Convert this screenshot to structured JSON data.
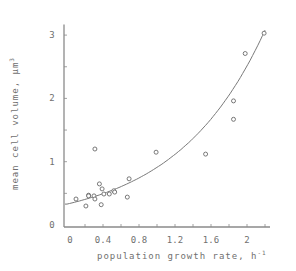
{
  "chart_data": {
    "type": "scatter",
    "title": "",
    "xlabel": "population growth rate, h",
    "xlabel_superscript": "-1",
    "ylabel": "mean cell volume, µm",
    "ylabel_superscript": "3",
    "xlim": [
      0,
      2.2
    ],
    "ylim": [
      0,
      3.2
    ],
    "x_ticks": [
      0,
      0.4,
      0.8,
      1.2,
      1.6,
      2
    ],
    "x_tick_labels": [
      "0",
      "0.4",
      "0.8",
      "1.2",
      "1.6",
      "2"
    ],
    "x_minor_tick_step": 0.2,
    "y_ticks": [
      0,
      1,
      2,
      3
    ],
    "y_tick_labels": [
      "0",
      "1",
      "2",
      "3"
    ],
    "y_minor_tick_step": 0.5,
    "grid": false,
    "legend": null,
    "series": [
      {
        "name": "observations",
        "kind": "scatter",
        "marker": "open-circle",
        "x": [
          0.1,
          0.21,
          0.24,
          0.24,
          0.3,
          0.31,
          0.36,
          0.39,
          0.38,
          0.41,
          0.47,
          0.52,
          0.53,
          0.69,
          0.67,
          0.31,
          0.99,
          1.54,
          1.85,
          1.85,
          1.98,
          2.19
        ],
        "y": [
          0.41,
          0.3,
          0.47,
          0.46,
          0.46,
          0.41,
          0.65,
          0.57,
          0.32,
          0.49,
          0.49,
          0.54,
          0.52,
          0.73,
          0.44,
          1.2,
          1.15,
          1.12,
          1.96,
          1.67,
          2.71,
          3.03
        ]
      },
      {
        "name": "exponential fit",
        "kind": "line",
        "equation": "y = 0.33 * exp(1.015 * x)",
        "a": 0.33,
        "b": 1.015,
        "x_range": [
          0,
          2.2
        ]
      }
    ]
  },
  "colors": {
    "axis": "#8a8a8a",
    "marker": "#6a6a6a",
    "curve": "#7a7a7a",
    "text": "#707070"
  }
}
